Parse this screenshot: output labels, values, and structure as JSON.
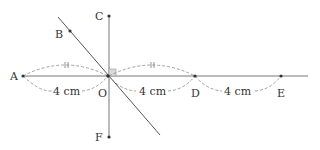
{
  "diagram": {
    "points": [
      {
        "name": "A",
        "x": 23,
        "y": 76,
        "label_dx": -13,
        "label_dy": 4
      },
      {
        "name": "O",
        "x": 108,
        "y": 76,
        "label_dx": -7,
        "label_dy": 16
      },
      {
        "name": "D",
        "x": 195,
        "y": 76,
        "label_dx": -4,
        "label_dy": 16
      },
      {
        "name": "E",
        "x": 281,
        "y": 76,
        "label_dx": -4,
        "label_dy": 16
      },
      {
        "name": "B",
        "x": 70,
        "y": 31,
        "label_dx": -15,
        "label_dy": 4
      },
      {
        "name": "C",
        "x": 109,
        "y": 16,
        "label_dx": -14,
        "label_dy": 4
      },
      {
        "name": "F",
        "x": 109,
        "y": 137,
        "label_dx": -14,
        "label_dy": 4
      }
    ],
    "segments_labels": [
      {
        "text": "4 cm",
        "x": 52,
        "y": 97
      },
      {
        "text": "4 cm",
        "x": 138,
        "y": 97
      },
      {
        "text": "4 cm",
        "x": 225,
        "y": 97
      }
    ],
    "tick_marks": "||",
    "colors": {
      "line": "#666666",
      "dash": "#888888",
      "right_angle_fill": "#d9d9d9",
      "point": "#333333"
    }
  }
}
